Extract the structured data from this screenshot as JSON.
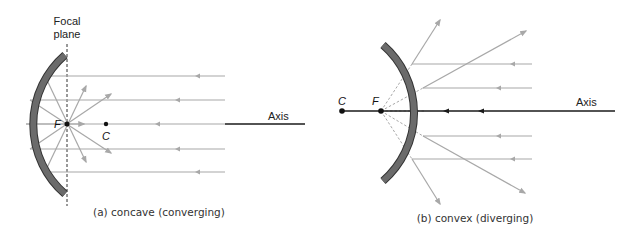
{
  "panels": {
    "a": {
      "caption": "(a) concave (converging)",
      "focal_plane_label_line1": "Focal",
      "focal_plane_label_line2": "plane",
      "point_f": "F",
      "point_c": "C",
      "axis_label": "Axis"
    },
    "b": {
      "caption": "(b) convex (diverging)",
      "point_f": "F",
      "point_c": "C",
      "axis_label": "Axis"
    }
  },
  "colors": {
    "mirror": "#6b6b6b",
    "ray": "#a8a8a8",
    "axis": "#1a1a1a"
  }
}
